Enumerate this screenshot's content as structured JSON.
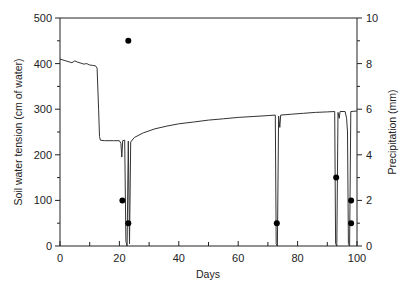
{
  "chart_data": {
    "type": "line",
    "title": "",
    "xlabel": "Days",
    "ylabel": "Soil water tension (cm of water)",
    "y2label": "Precipitation (mm)",
    "xlim": [
      0,
      100
    ],
    "ylim": [
      0,
      500
    ],
    "y2lim": [
      0,
      10
    ],
    "x_ticks": [
      0,
      20,
      40,
      60,
      80,
      100
    ],
    "y_ticks": [
      0,
      100,
      200,
      300,
      400,
      500
    ],
    "y2_ticks": [
      0,
      2,
      4,
      6,
      8,
      10
    ],
    "grid": false,
    "series": [
      {
        "name": "Soil water tension",
        "axis": "left",
        "style": "line",
        "points": [
          [
            0,
            410
          ],
          [
            1,
            408
          ],
          [
            2,
            406
          ],
          [
            3,
            404
          ],
          [
            4,
            402
          ],
          [
            5,
            406
          ],
          [
            6,
            403
          ],
          [
            7,
            401
          ],
          [
            8,
            399
          ],
          [
            9,
            400
          ],
          [
            10,
            397
          ],
          [
            11,
            396
          ],
          [
            12,
            395
          ],
          [
            12.5,
            390
          ],
          [
            13,
            300
          ],
          [
            13.3,
            240
          ],
          [
            13.6,
            232
          ],
          [
            15,
            231
          ],
          [
            18,
            231
          ],
          [
            20,
            231
          ],
          [
            20.5,
            225
          ],
          [
            20.8,
            195
          ],
          [
            21.1,
            231
          ],
          [
            21.8,
            232
          ],
          [
            22.2,
            10
          ],
          [
            22.6,
            0
          ],
          [
            23,
            230
          ],
          [
            23.4,
            5
          ],
          [
            23.8,
            228
          ],
          [
            25,
            238
          ],
          [
            28,
            248
          ],
          [
            32,
            257
          ],
          [
            36,
            263
          ],
          [
            40,
            268
          ],
          [
            45,
            272
          ],
          [
            50,
            276
          ],
          [
            55,
            279
          ],
          [
            60,
            282
          ],
          [
            65,
            284
          ],
          [
            70,
            286
          ],
          [
            72.5,
            287
          ],
          [
            72.8,
            5
          ],
          [
            73.2,
            0
          ],
          [
            73.6,
            285
          ],
          [
            74,
            260
          ],
          [
            74.3,
            287
          ],
          [
            78,
            289
          ],
          [
            82,
            291
          ],
          [
            86,
            293
          ],
          [
            90,
            294
          ],
          [
            92.5,
            295
          ],
          [
            92.8,
            5
          ],
          [
            93.2,
            0
          ],
          [
            93.6,
            293
          ],
          [
            94,
            280
          ],
          [
            94.3,
            295
          ],
          [
            96,
            295
          ],
          [
            96.5,
            280
          ],
          [
            96.8,
            250
          ],
          [
            97.1,
            5
          ],
          [
            97.5,
            0
          ],
          [
            97.9,
            295
          ],
          [
            100,
            296
          ]
        ]
      },
      {
        "name": "Precipitation",
        "axis": "right",
        "style": "points",
        "points": [
          [
            21,
            2
          ],
          [
            23,
            1
          ],
          [
            23,
            9
          ],
          [
            73,
            1
          ],
          [
            93,
            3
          ],
          [
            98,
            2
          ],
          [
            98,
            1
          ]
        ]
      }
    ]
  }
}
